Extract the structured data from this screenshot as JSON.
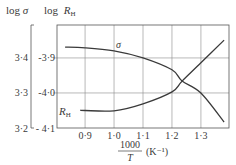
{
  "chart_data": {
    "type": "line",
    "title": "",
    "xlabel": {
      "numerator": "1000",
      "denominator": "T",
      "unit": "(K⁻¹)"
    },
    "ylabel_left": {
      "prefix": "log",
      "symbol": "σ"
    },
    "ylabel_right": {
      "prefix": "log",
      "symbol": "R",
      "subscript": "H"
    },
    "xlim": [
      0.803,
      1.397
    ],
    "x_ticks": [
      {
        "value": 0.9,
        "label": "0·9"
      },
      {
        "value": 1.0,
        "label": "1·0"
      },
      {
        "value": 1.1,
        "label": "1·1"
      },
      {
        "value": 1.2,
        "label": "1·2"
      },
      {
        "value": 1.3,
        "label": "1·3"
      }
    ],
    "ylim_left": [
      3.2,
      3.494
    ],
    "y_ticks_left": [
      {
        "value": 3.4,
        "label": "3·4"
      },
      {
        "value": 3.3,
        "label": "3·3"
      },
      {
        "value": 3.2,
        "label": "3·2"
      }
    ],
    "ylim_right": [
      -4.1,
      -3.806
    ],
    "y_ticks_right": [
      {
        "value": -3.9,
        "label": "-3·9"
      },
      {
        "value": -4.0,
        "label": "-4·0"
      },
      {
        "value": -4.1,
        "label": "- 4·1"
      }
    ],
    "grid": true,
    "legend": "inline curve labels",
    "series": [
      {
        "name": "σ",
        "axis": "left",
        "label": "σ",
        "x": [
          0.831,
          0.9,
          1.0,
          1.1,
          1.2,
          1.235,
          1.3,
          1.38
        ],
        "values": [
          3.431,
          3.429,
          3.42,
          3.4,
          3.366,
          3.334,
          3.3,
          3.217
        ]
      },
      {
        "name": "R_H",
        "axis": "right",
        "label": "R",
        "label_sub": "H",
        "x": [
          0.883,
          0.9,
          1.0,
          1.1,
          1.2,
          1.235,
          1.3,
          1.38
        ],
        "values": [
          -4.049,
          -4.05,
          -4.051,
          -4.031,
          -3.997,
          -3.966,
          -3.914,
          -3.849
        ]
      }
    ]
  }
}
